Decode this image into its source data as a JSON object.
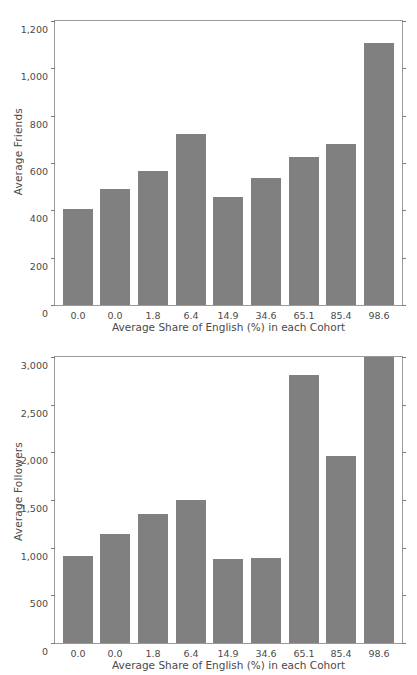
{
  "chart_data": [
    {
      "type": "bar",
      "title": "",
      "xlabel": "Average Share of English (%) in each Cohort",
      "ylabel": "Average Friends",
      "categories": [
        "0.0",
        "0.0",
        "1.8",
        "6.4",
        "14.9",
        "34.6",
        "65.1",
        "85.4",
        "98.6"
      ],
      "values": [
        405,
        492,
        568,
        722,
        458,
        535,
        627,
        680,
        1108
      ],
      "ylim": [
        0,
        1200
      ],
      "yticks": [
        0,
        200,
        400,
        600,
        800,
        1000,
        1200
      ],
      "ytick_labels": [
        "0",
        "200",
        "400",
        "600",
        "800",
        "1,000",
        "1,200"
      ],
      "grid": false,
      "legend": "none",
      "bar_color": "#808080"
    },
    {
      "type": "bar",
      "title": "",
      "xlabel": "Average Share of English (%) in each Cohort",
      "ylabel": "Average Followers",
      "categories": [
        "0.0",
        "0.0",
        "1.8",
        "6.4",
        "14.9",
        "34.6",
        "65.1",
        "85.4",
        "98.6"
      ],
      "values": [
        910,
        1140,
        1355,
        1500,
        880,
        895,
        2815,
        1965,
        3000
      ],
      "ylim": [
        0,
        3000
      ],
      "yticks": [
        0,
        500,
        1000,
        1500,
        2000,
        2500,
        3000
      ],
      "ytick_labels": [
        "0",
        "500",
        "1,000",
        "1,500",
        "2,000",
        "2,500",
        "3,000"
      ],
      "grid": false,
      "legend": "none",
      "bar_color": "#808080",
      "notes": "Last bar (98.6) is clipped at the top of the axis at 3,000."
    }
  ]
}
